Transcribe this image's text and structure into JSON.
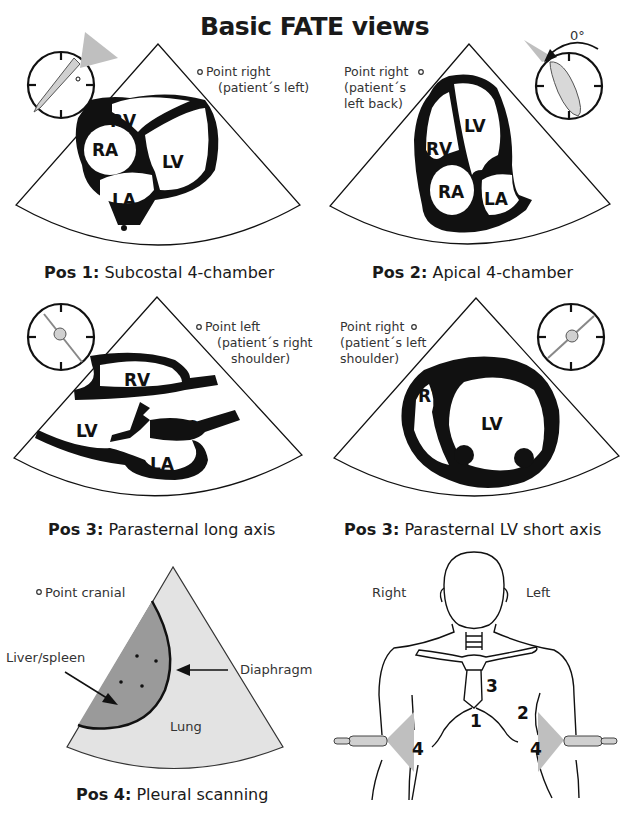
{
  "title": "Basic FATE views",
  "colors": {
    "ink": "#111111",
    "probe_beam": "#bfbfbf",
    "liver": "#9a9a9a",
    "lung_field": "#e3e3e3",
    "background": "#ffffff"
  },
  "panels": [
    {
      "id": "pos1",
      "caption_bold": "Pos 1:",
      "caption_text": " Subcostal 4-chamber",
      "orientation_note": [
        "Point right",
        "(patient´s left)"
      ],
      "chambers": [
        "RV",
        "RA",
        "LV",
        "LA"
      ],
      "icons": [
        "clock-probe-icon",
        "orientation-marker-icon"
      ]
    },
    {
      "id": "pos2",
      "caption_bold": "Pos 2:",
      "caption_text": " Apical 4-chamber",
      "orientation_note": [
        "Point right",
        "(patient´s",
        "left back)"
      ],
      "rotation_label": "0°",
      "chambers": [
        "LV",
        "RV",
        "RA",
        "LA"
      ],
      "icons": [
        "clock-probe-icon",
        "rotation-arrow-icon",
        "orientation-marker-icon"
      ]
    },
    {
      "id": "pos3_long",
      "caption_bold": "Pos 3:",
      "caption_text": " Parasternal long axis",
      "orientation_note": [
        "Point left",
        "(patient´s right",
        "shoulder)"
      ],
      "chambers": [
        "RV",
        "AO",
        "LV",
        "LA"
      ],
      "icons": [
        "clock-probe-icon",
        "orientation-marker-icon"
      ]
    },
    {
      "id": "pos3_short",
      "caption_bold": "Pos 3:",
      "caption_text": " Parasternal LV short axis",
      "orientation_note": [
        "Point right",
        "(patient´s left",
        "shoulder)"
      ],
      "chambers": [
        "RV",
        "LV"
      ],
      "icons": [
        "clock-probe-icon",
        "orientation-marker-icon"
      ]
    },
    {
      "id": "pos4",
      "caption_bold": "Pos 4:",
      "caption_text": " Pleural scanning",
      "orientation_note": [
        "Point cranial"
      ],
      "labels": {
        "organ": "Liver/spleen",
        "diaphragm": "Diaphragm",
        "lung": "Lung"
      },
      "icons": [
        "orientation-marker-icon",
        "arrow-icon"
      ]
    },
    {
      "id": "body",
      "side_labels": {
        "right": "Right",
        "left": "Left"
      },
      "position_numbers": [
        "1",
        "2",
        "3",
        "4",
        "4"
      ],
      "icons": [
        "torso-outline-icon",
        "probe-icon"
      ]
    }
  ]
}
